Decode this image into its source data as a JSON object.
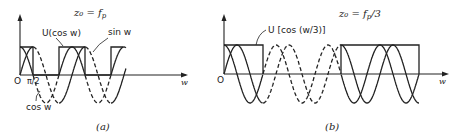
{
  "panel_a": {
    "title": "z₀ = f",
    "title_sub": "p",
    "label_U": "U(cos w)",
    "label_sin": "sin w",
    "label_cos": "cos w",
    "origin": "O",
    "tick_pi2": "π/2",
    "axis_x": "w",
    "caption": "(a)"
  },
  "panel_b": {
    "title": "z₀ = f",
    "title_sub": "p",
    "title_suffix": "/3",
    "label_U": "U [cos (w/3)]",
    "origin": "O",
    "axis_x": "w",
    "caption": "(b)"
  },
  "colors": {
    "ink": "#222222",
    "background": "#ffffff"
  }
}
